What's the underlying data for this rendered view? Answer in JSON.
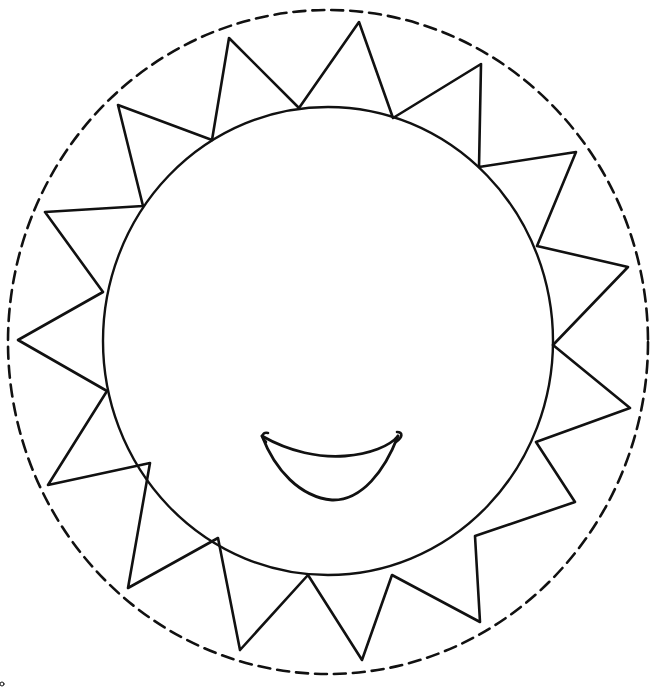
{
  "image": {
    "subject": "smiling sun coloring page",
    "width": 655,
    "height": 690,
    "background": "#ffffff",
    "ink_color": "#111111"
  },
  "cut_line": {
    "style": "dashed",
    "cx": 328,
    "cy": 342,
    "rx": 320,
    "ry": 332,
    "stroke_width": 2.6,
    "dash": "12 7"
  },
  "sun_face": {
    "cx": 328,
    "cy": 341,
    "rx": 225,
    "ry": 234,
    "stroke_width": 2.4
  },
  "rays": {
    "count": 15,
    "stroke_width": 2.6,
    "points": [
      [
        299,
        108
      ],
      [
        359,
        22
      ],
      [
        393,
        118
      ],
      [
        481,
        64
      ],
      [
        479,
        167
      ],
      [
        576,
        152
      ],
      [
        537,
        246
      ],
      [
        628,
        267
      ],
      [
        553,
        345
      ],
      [
        630,
        408
      ],
      [
        536,
        442
      ],
      [
        575,
        502
      ],
      [
        475,
        536
      ],
      [
        480,
        622
      ],
      [
        392,
        575
      ],
      [
        362,
        660
      ],
      [
        308,
        575
      ],
      [
        240,
        650
      ],
      [
        218,
        538
      ],
      [
        128,
        588
      ],
      [
        150,
        463
      ],
      [
        48,
        485
      ],
      [
        107,
        391
      ],
      [
        18,
        340
      ],
      [
        103,
        292
      ],
      [
        45,
        212
      ],
      [
        143,
        206
      ],
      [
        118,
        105
      ],
      [
        212,
        140
      ],
      [
        229,
        38
      ]
    ]
  },
  "smile": {
    "stroke_width": 2.8
  },
  "corner_mark": {
    "x": 2,
    "y": 684
  }
}
